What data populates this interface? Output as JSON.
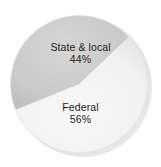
{
  "chart_data": {
    "type": "pie",
    "title": "",
    "subtitle": "",
    "xlabel": "",
    "ylabel": "",
    "legend": "none",
    "grid": false,
    "labels_inside_slices": true,
    "categories": [
      "State & local",
      "Federal"
    ],
    "values": [
      44,
      56
    ],
    "value_unit": "%",
    "slices": [
      {
        "name": "State & local",
        "value": 44,
        "value_label": "44%",
        "color": "#c9c9c9",
        "start_angle_deg": 158,
        "end_angle_deg": 316
      },
      {
        "name": "Federal",
        "value": 56,
        "value_label": "56%",
        "color": "#f2f2f2",
        "start_angle_deg": 316,
        "end_angle_deg": 518
      }
    ],
    "colors": {
      "state_local_slice": "#c9c9c9",
      "federal_slice": "#f2f2f2",
      "shadow": "#b8b8b8",
      "background": "#ffffff",
      "label_text": "#1c1c1c"
    }
  },
  "labels": {
    "state_local": {
      "name": "State & local",
      "value": "44%"
    },
    "federal": {
      "name": "Federal",
      "value": "56%"
    }
  }
}
